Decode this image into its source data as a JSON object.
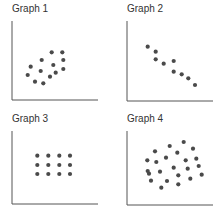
{
  "colors": {
    "dot": "#4a4a4a",
    "axis": "#555555",
    "text": "#333333"
  },
  "chart_data": [
    {
      "type": "scatter",
      "title": "Graph 1",
      "xlabel": "",
      "ylabel": "",
      "grid": false,
      "description": "moderate positive correlation",
      "points": [
        [
          51.7,
          52.3
        ],
        [
          62.3,
          52.3
        ],
        [
          41.7,
          60
        ],
        [
          63.3,
          60
        ],
        [
          53.3,
          65
        ],
        [
          30.7,
          66.7
        ],
        [
          40.7,
          71
        ],
        [
          63.3,
          69
        ],
        [
          55.7,
          72.7
        ],
        [
          27.7,
          75
        ],
        [
          50,
          76.7
        ],
        [
          35,
          81.7
        ],
        [
          43.3,
          83.3
        ]
      ],
      "axes": {
        "x0": 12,
        "y0": 100,
        "x1": 98,
        "ytop": 21
      }
    },
    {
      "type": "scatter",
      "title": "Graph 2",
      "xlabel": "",
      "ylabel": "",
      "grid": false,
      "description": "strong negative correlation",
      "points": [
        [
          147.7,
          46.7
        ],
        [
          155.7,
          51.7
        ],
        [
          155.7,
          59.3
        ],
        [
          163.7,
          63.7
        ],
        [
          173.7,
          61
        ],
        [
          173.7,
          71.7
        ],
        [
          181.7,
          74.3
        ],
        [
          188.3,
          78.3
        ],
        [
          195,
          85
        ]
      ],
      "axes": {
        "x0": 127,
        "y0": 101,
        "x1": 213,
        "ytop": 21
      }
    },
    {
      "type": "scatter",
      "title": "Graph 3",
      "xlabel": "",
      "ylabel": "",
      "grid": false,
      "description": "regular 4x3 grid, no correlation",
      "points": [
        [
          37.3,
          155.7
        ],
        [
          48.3,
          155.7
        ],
        [
          59.3,
          155.7
        ],
        [
          70,
          155.7
        ],
        [
          37.3,
          165
        ],
        [
          48.3,
          165
        ],
        [
          59.3,
          165
        ],
        [
          70,
          165
        ],
        [
          37.3,
          174
        ],
        [
          48.3,
          174
        ],
        [
          59.3,
          174
        ],
        [
          70,
          174
        ]
      ],
      "axes": {
        "x0": 12,
        "y0": 204,
        "x1": 98,
        "ytop": 131
      }
    },
    {
      "type": "scatter",
      "title": "Graph 4",
      "xlabel": "",
      "ylabel": "",
      "grid": false,
      "description": "random scatter, no correlation",
      "points": [
        [
          183.7,
          142
        ],
        [
          169.7,
          146
        ],
        [
          193,
          148.7
        ],
        [
          155,
          151.3
        ],
        [
          177.3,
          152.7
        ],
        [
          166,
          157.7
        ],
        [
          147.3,
          160.3
        ],
        [
          185.7,
          160.3
        ],
        [
          196.3,
          158.7
        ],
        [
          156.3,
          162
        ],
        [
          198.7,
          166
        ],
        [
          173.7,
          167.7
        ],
        [
          187.7,
          168.7
        ],
        [
          147.7,
          171
        ],
        [
          149,
          173.7
        ],
        [
          160,
          171.7
        ],
        [
          178.3,
          175.3
        ],
        [
          201.7,
          174.7
        ],
        [
          190.3,
          178.7
        ],
        [
          151,
          180.7
        ],
        [
          167,
          181
        ],
        [
          178.3,
          184.3
        ],
        [
          161.3,
          187.7
        ]
      ],
      "axes": {
        "x0": 127,
        "y0": 205,
        "x1": 213,
        "ytop": 131
      }
    }
  ]
}
